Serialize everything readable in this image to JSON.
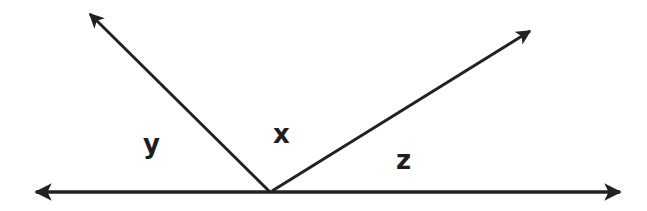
{
  "diagram": {
    "type": "angles-on-a-line",
    "stroke_color": "#222222",
    "label_color": "#1e1e1e",
    "vertex": {
      "x": 270,
      "y": 192
    },
    "rays": [
      {
        "name": "left-baseline",
        "to": {
          "x": 34,
          "y": 192
        }
      },
      {
        "name": "right-baseline",
        "to": {
          "x": 622,
          "y": 192
        }
      },
      {
        "name": "upper-left",
        "to": {
          "x": 88,
          "y": 12
        }
      },
      {
        "name": "upper-right",
        "to": {
          "x": 532,
          "y": 30
        }
      }
    ],
    "labels": {
      "y": "y",
      "x": "x",
      "z": "z"
    }
  }
}
